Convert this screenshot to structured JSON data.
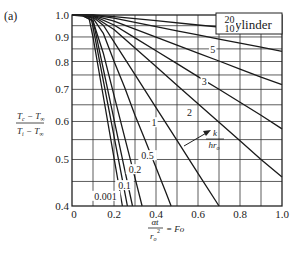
{
  "panel_label": "(a)",
  "chart_data": {
    "type": "line",
    "title": "Cylinder",
    "panel": "(a)",
    "xlabel": "αt / r_o² = Fo",
    "ylabel": "(T_c − T_∞) / (T_i − T_∞)",
    "xlim": [
      0,
      1.0
    ],
    "ylim": [
      0.4,
      1.0
    ],
    "yscale": "log",
    "grid": true,
    "x_ticks": [
      0,
      0.2,
      0.4,
      0.6,
      0.8,
      1.0
    ],
    "x_tick_labels": [
      "0",
      "0.2",
      "0.4",
      "0.6",
      "0.8",
      "1.0"
    ],
    "y_ticks": [
      0.4,
      0.5,
      0.6,
      0.7,
      0.8,
      0.9,
      1.0
    ],
    "y_tick_labels": [
      "0.4",
      "0.5",
      "0.6",
      "0.7",
      "0.8",
      "0.9",
      "1.0"
    ],
    "x_grid": [
      0.1,
      0.2,
      0.3,
      0.4,
      0.5,
      0.6,
      0.7,
      0.8,
      0.9
    ],
    "y_grid": [
      0.45,
      0.5,
      0.55,
      0.6,
      0.65,
      0.7,
      0.75,
      0.8,
      0.85,
      0.9,
      0.95
    ],
    "parameter_label": "k / (h r_o)",
    "series": [
      {
        "name": "0.001",
        "x": [
          0,
          0.05,
          0.08,
          0.1,
          0.15,
          0.2,
          0.24
        ],
        "y": [
          1,
          1,
          0.99,
          0.899,
          0.673,
          0.504,
          0.4
        ]
      },
      {
        "name": "0.05",
        "x": [
          0,
          0.05,
          0.09,
          0.1,
          0.15,
          0.2,
          0.25,
          0.264
        ],
        "y": [
          1,
          1,
          0.99,
          0.943,
          0.726,
          0.559,
          0.43,
          0.4
        ]
      },
      {
        "name": "0.1",
        "x": [
          0,
          0.05,
          0.1,
          0.15,
          0.2,
          0.25,
          0.288
        ],
        "y": [
          1,
          0.995,
          0.975,
          0.769,
          0.606,
          0.478,
          0.4
        ]
      },
      {
        "name": "0.2",
        "x": [
          0,
          0.05,
          0.1,
          0.15,
          0.2,
          0.25,
          0.3,
          0.334
        ],
        "y": [
          1,
          0.998,
          0.97,
          0.83,
          0.68,
          0.558,
          0.458,
          0.4
        ]
      },
      {
        "name": "0.5",
        "x": [
          0,
          0.05,
          0.1,
          0.15,
          0.2,
          0.25,
          0.3,
          0.35,
          0.4,
          0.45,
          0.472
        ],
        "y": [
          1,
          0.998,
          0.985,
          0.914,
          0.801,
          0.708,
          0.618,
          0.546,
          0.481,
          0.424,
          0.4
        ]
      },
      {
        "name": "1",
        "x": [
          0,
          0.05,
          0.1,
          0.15,
          0.2,
          0.3,
          0.4,
          0.5,
          0.6,
          0.7
        ],
        "y": [
          1,
          0.999,
          0.99,
          0.951,
          0.879,
          0.751,
          0.641,
          0.548,
          0.468,
          0.4
        ]
      },
      {
        "name": "2",
        "x": [
          0,
          0.05,
          0.1,
          0.2,
          0.3,
          0.4,
          0.5,
          0.6,
          0.7,
          0.8,
          0.9,
          1.0
        ],
        "y": [
          1,
          1,
          0.995,
          0.933,
          0.854,
          0.781,
          0.714,
          0.653,
          0.598,
          0.547,
          0.5,
          0.46
        ]
      },
      {
        "name": "3",
        "x": [
          0,
          0.05,
          0.1,
          0.2,
          0.3,
          0.4,
          0.5,
          0.6,
          0.7,
          0.8,
          0.9,
          1.0
        ],
        "y": [
          1,
          1,
          0.997,
          0.953,
          0.896,
          0.842,
          0.792,
          0.744,
          0.7,
          0.658,
          0.618,
          0.579
        ]
      },
      {
        "name": "5",
        "x": [
          0,
          0.05,
          0.1,
          0.2,
          0.3,
          0.4,
          0.5,
          0.6,
          0.7,
          0.8,
          0.9,
          1.0
        ],
        "y": [
          1,
          1,
          0.998,
          0.971,
          0.934,
          0.899,
          0.865,
          0.833,
          0.802,
          0.771,
          0.742,
          0.716
        ]
      },
      {
        "name": "10",
        "x": [
          0,
          0.1,
          0.2,
          0.3,
          0.4,
          0.5,
          0.6,
          0.7,
          0.8,
          0.9,
          1.0
        ],
        "y": [
          1,
          0.999,
          0.985,
          0.965,
          0.946,
          0.927,
          0.909,
          0.891,
          0.874,
          0.857,
          0.84
        ]
      },
      {
        "name": "20",
        "x": [
          0,
          0.1,
          0.2,
          0.4,
          0.6,
          0.8,
          1.0
        ],
        "y": [
          1,
          1,
          0.992,
          0.973,
          0.953,
          0.934,
          0.915
        ]
      }
    ],
    "curve_labels": [
      {
        "text": "20",
        "x": 0.75,
        "y": 0.975
      },
      {
        "text": "10",
        "x": 0.75,
        "y": 0.935
      },
      {
        "text": "5",
        "x": 0.67,
        "y": 0.845
      },
      {
        "text": "3",
        "x": 0.63,
        "y": 0.725
      },
      {
        "text": "2",
        "x": 0.56,
        "y": 0.625
      },
      {
        "text": "1",
        "x": 0.39,
        "y": 0.595
      },
      {
        "text": "0.5",
        "x": 0.36,
        "y": 0.508
      },
      {
        "text": "0.2",
        "x": 0.3,
        "y": 0.475
      },
      {
        "text": "0.1",
        "x": 0.25,
        "y": 0.44
      },
      {
        "text": "0.001",
        "x": 0.16,
        "y": 0.418
      }
    ]
  }
}
